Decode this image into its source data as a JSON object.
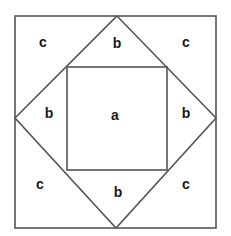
{
  "diagram": {
    "title": "",
    "stroke_color": "#555555",
    "label_color": "#1a1a1a",
    "outer_square": {
      "x1": 15,
      "y1": 16,
      "x2": 216,
      "y2": 228
    },
    "diamond": {
      "top": [
        117,
        16
      ],
      "right": [
        216,
        118
      ],
      "bottom": [
        116,
        228
      ],
      "left": [
        15,
        118
      ]
    },
    "inner_square": {
      "x1": 67,
      "y1": 67,
      "x2": 167,
      "y2": 170
    },
    "labels": [
      {
        "id": "center",
        "text": "a",
        "x": 115,
        "y": 116
      },
      {
        "id": "top",
        "text": "b",
        "x": 117,
        "y": 44
      },
      {
        "id": "left",
        "text": "b",
        "x": 49,
        "y": 114
      },
      {
        "id": "right",
        "text": "b",
        "x": 186,
        "y": 114
      },
      {
        "id": "bottom",
        "text": "b",
        "x": 118,
        "y": 193
      },
      {
        "id": "corner-top-left",
        "text": "c",
        "x": 43,
        "y": 43
      },
      {
        "id": "corner-top-right",
        "text": "c",
        "x": 186,
        "y": 43
      },
      {
        "id": "corner-bottom-left",
        "text": "c",
        "x": 40,
        "y": 185
      },
      {
        "id": "corner-bottom-right",
        "text": "c",
        "x": 186,
        "y": 185
      }
    ]
  }
}
